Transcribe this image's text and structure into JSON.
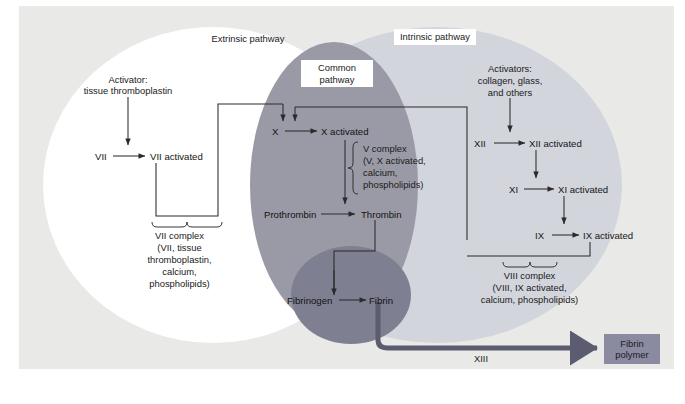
{
  "figure": {
    "type": "diagram"
  },
  "colors": {
    "page_background": "#ffffff",
    "canvas_background": "#e9e9e7",
    "extrinsic_fill": "#ffffff",
    "intrinsic_fill": "#d3d5dd",
    "common_fill": "#9a9aa6",
    "fibrin_circle_fill": "#7f7f92",
    "fibrin_polymer_fill": "#8a8aa0",
    "line_color": "#2b2b2b",
    "thick_arrow_color": "#5c5c70",
    "text_color": "#1a1a1a"
  },
  "pathway_labels": {
    "extrinsic": "Extrinsic pathway",
    "intrinsic": "Intrinsic pathway",
    "common_line1": "Common",
    "common_line2": "pathway"
  },
  "extrinsic": {
    "activator_line1": "Activator:",
    "activator_line2": "tissue thromboplastin",
    "factor": "VII",
    "factor_activated": "VII activated",
    "complex": [
      "VII complex",
      "(VII, tissue",
      "thromboplastin,",
      "calcium,",
      "phospholipids)"
    ]
  },
  "intrinsic": {
    "activator_line1": "Activators:",
    "activator_line2": "collagen, glass,",
    "activator_line3": "and others",
    "steps": [
      {
        "factor": "XII",
        "activated": "XII activated"
      },
      {
        "factor": "XI",
        "activated": "XI activated"
      },
      {
        "factor": "IX",
        "activated": "IX activated"
      }
    ],
    "complex": [
      "VIII complex",
      "(VIII, IX activated,",
      "calcium, phospholipids)"
    ]
  },
  "common": {
    "factor_x": "X",
    "factor_x_activated": "X activated",
    "v_complex": [
      "V complex",
      "(V, X activated,",
      "calcium,",
      "phospholipids)"
    ],
    "prothrombin": "Prothrombin",
    "thrombin": "Thrombin",
    "fibrinogen": "Fibrinogen",
    "fibrin": "Fibrin"
  },
  "output": {
    "factor_xiii": "XIII",
    "product_line1": "Fibrin",
    "product_line2": "polymer"
  }
}
